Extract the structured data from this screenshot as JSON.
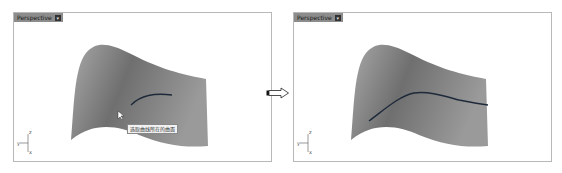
{
  "figure": {
    "left_panel": {
      "viewport_label": "Perspective",
      "tooltip": "选取曲线所在的曲面",
      "axes": {
        "y": "y",
        "z": "z",
        "x": "x"
      },
      "curve": "short-curve-on-surface"
    },
    "right_panel": {
      "viewport_label": "Perspective",
      "axes": {
        "y": "y",
        "z": "z",
        "x": "x"
      },
      "curve": "extended-curve-across-surface"
    },
    "transition_icon": "right-arrow-icon",
    "colors": {
      "surface_light": "#b0b0b0",
      "surface_dark": "#6e6e6e",
      "curve": "#1e2a3a",
      "viewport_border": "#b8b8b8",
      "tab_bg": "#8c8c8c"
    }
  }
}
